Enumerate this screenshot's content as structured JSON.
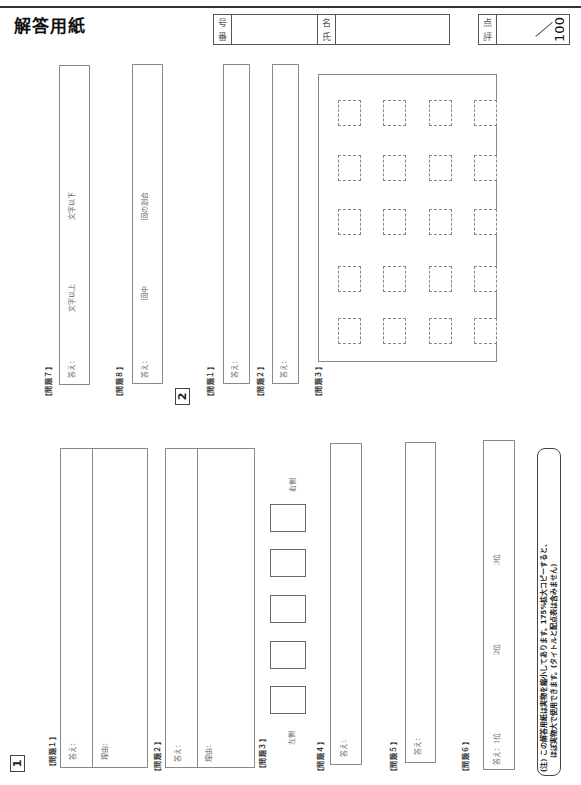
{
  "header": {
    "title": "解答用紙",
    "number_label_1": "番",
    "number_label_2": "号",
    "name_label_1": "氏",
    "name_label_2": "名",
    "score_label_1": "評",
    "score_label_2": "点",
    "score_max": "100"
  },
  "section1": {
    "marker": "1",
    "q1": {
      "label": "【問題１】",
      "answer_label": "答え：",
      "reason_label": "理由："
    },
    "q2": {
      "label": "【問題２】",
      "answer_label": "答え：",
      "reason_label": "理由："
    },
    "q3": {
      "label": "【問題３】",
      "left_label": "左側",
      "right_label": "右側",
      "box_count": 5
    },
    "q4": {
      "label": "【問題４】",
      "answer_label": "答え："
    },
    "q5": {
      "label": "【問題５】",
      "answer_label": "答え："
    },
    "q6": {
      "label": "【問題６】",
      "answer_label": "答え：1位",
      "second_label": "2位",
      "third_label": "3位"
    },
    "q7": {
      "label": "【問題７】",
      "answer_label": "答え：",
      "min_label": "文字以上",
      "max_label": "文字以下"
    },
    "q8": {
      "label": "【問題８】",
      "answer_label": "答え：",
      "mid_label": "回中",
      "end_label": "回の割合"
    }
  },
  "section2": {
    "marker": "2",
    "q1": {
      "label": "【問題１】",
      "answer_label": "答え："
    },
    "q2": {
      "label": "【問題２】",
      "answer_label": "答え："
    },
    "q3": {
      "label": "【問題３】",
      "grid_rows": 5,
      "grid_cols": 4
    }
  },
  "note": {
    "line1": "(注) この解答用紙は実物を縮小してあります。175%拡大コピーすると、",
    "line2": "ほぼ実物大で使用できます。(タイトルと配点表は含みません)"
  }
}
